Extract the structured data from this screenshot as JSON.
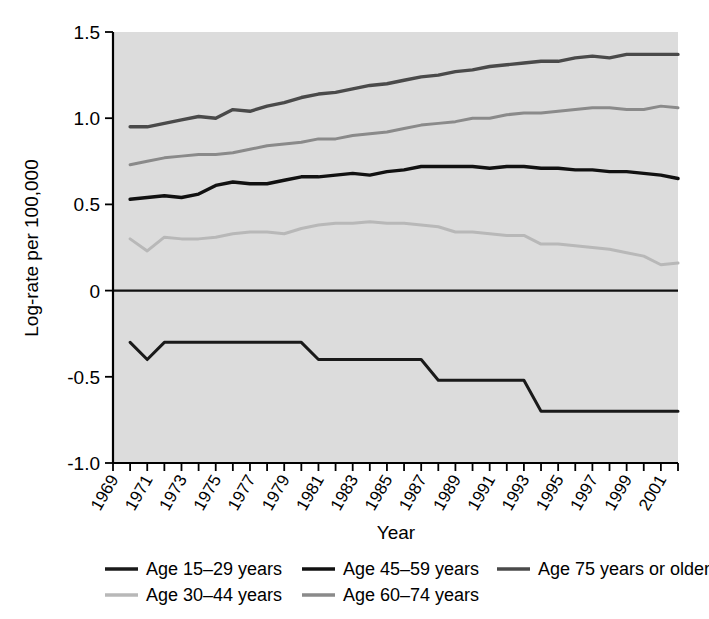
{
  "chart_data": {
    "type": "line",
    "title": "",
    "xlabel": "Year",
    "ylabel": "Log-rate per 100,000",
    "xlim": [
      1969,
      2002
    ],
    "ylim": [
      -1.0,
      1.5
    ],
    "yticks": [
      -1.0,
      -0.5,
      0,
      0.5,
      1.0,
      1.5
    ],
    "ytick_labels": [
      "-1.0",
      "-0.5",
      "0",
      "0.5",
      "1.0",
      "1.5"
    ],
    "xticks": [
      1969,
      1970,
      1971,
      1972,
      1973,
      1974,
      1975,
      1976,
      1977,
      1978,
      1979,
      1980,
      1981,
      1982,
      1983,
      1984,
      1985,
      1986,
      1987,
      1988,
      1989,
      1990,
      1991,
      1992,
      1993,
      1994,
      1995,
      1996,
      1997,
      1998,
      1999,
      2000,
      2001,
      2002
    ],
    "xtick_labels": [
      "1969",
      "1971",
      "1973",
      "1975",
      "1977",
      "1979",
      "1981",
      "1983",
      "1985",
      "1987",
      "1989",
      "1991",
      "1993",
      "1995",
      "1997",
      "1999",
      "2001"
    ],
    "xtick_label_years": [
      1969,
      1971,
      1973,
      1975,
      1977,
      1979,
      1981,
      1983,
      1985,
      1987,
      1989,
      1991,
      1993,
      1995,
      1997,
      1999,
      2001
    ],
    "grid": false,
    "legend_position": "bottom",
    "x": [
      1970,
      1971,
      1972,
      1973,
      1974,
      1975,
      1976,
      1977,
      1978,
      1979,
      1980,
      1981,
      1982,
      1983,
      1984,
      1985,
      1986,
      1987,
      1988,
      1989,
      1990,
      1991,
      1992,
      1993,
      1994,
      1995,
      1996,
      1997,
      1998,
      1999,
      2000,
      2001,
      2002
    ],
    "series": [
      {
        "name": "Age 15-29 years",
        "color": "#1a1a1a",
        "width": 3.0,
        "values": [
          -0.3,
          -0.4,
          -0.3,
          -0.3,
          -0.3,
          -0.3,
          -0.3,
          -0.3,
          -0.3,
          -0.3,
          -0.3,
          -0.4,
          -0.4,
          -0.4,
          -0.4,
          -0.4,
          -0.4,
          -0.4,
          -0.52,
          -0.52,
          -0.52,
          -0.52,
          -0.52,
          -0.52,
          -0.7,
          -0.7,
          -0.7,
          -0.7,
          -0.7,
          -0.7,
          -0.7,
          -0.7,
          -0.7
        ]
      },
      {
        "name": "Age 30-44 years",
        "color": "#b8b8b8",
        "width": 3.0,
        "values": [
          0.3,
          0.23,
          0.31,
          0.3,
          0.3,
          0.31,
          0.33,
          0.34,
          0.34,
          0.33,
          0.36,
          0.38,
          0.39,
          0.39,
          0.4,
          0.39,
          0.39,
          0.38,
          0.37,
          0.34,
          0.34,
          0.33,
          0.32,
          0.32,
          0.27,
          0.27,
          0.26,
          0.25,
          0.24,
          0.22,
          0.2,
          0.15,
          0.16
        ]
      },
      {
        "name": "Age 45-59 years",
        "color": "#111111",
        "width": 3.4,
        "values": [
          0.53,
          0.54,
          0.55,
          0.54,
          0.56,
          0.61,
          0.63,
          0.62,
          0.62,
          0.64,
          0.66,
          0.66,
          0.67,
          0.68,
          0.67,
          0.69,
          0.7,
          0.72,
          0.72,
          0.72,
          0.72,
          0.71,
          0.72,
          0.72,
          0.71,
          0.71,
          0.7,
          0.7,
          0.69,
          0.69,
          0.68,
          0.67,
          0.65
        ]
      },
      {
        "name": "Age 60-74 years",
        "color": "#8a8a8a",
        "width": 3.0,
        "values": [
          0.73,
          0.75,
          0.77,
          0.78,
          0.79,
          0.79,
          0.8,
          0.82,
          0.84,
          0.85,
          0.86,
          0.88,
          0.88,
          0.9,
          0.91,
          0.92,
          0.94,
          0.96,
          0.97,
          0.98,
          1.0,
          1.0,
          1.02,
          1.03,
          1.03,
          1.04,
          1.05,
          1.06,
          1.06,
          1.05,
          1.05,
          1.07,
          1.06
        ]
      },
      {
        "name": "Age 75 years or older",
        "color": "#4a4a4a",
        "width": 3.4,
        "values": [
          0.95,
          0.95,
          0.97,
          0.99,
          1.01,
          1.0,
          1.05,
          1.04,
          1.07,
          1.09,
          1.12,
          1.14,
          1.15,
          1.17,
          1.19,
          1.2,
          1.22,
          1.24,
          1.25,
          1.27,
          1.28,
          1.3,
          1.31,
          1.32,
          1.33,
          1.33,
          1.35,
          1.36,
          1.35,
          1.37,
          1.37,
          1.37,
          1.37
        ]
      }
    ]
  },
  "legend": {
    "entries": [
      {
        "label": "Age 15–29 years",
        "color": "#1a1a1a",
        "col": 0,
        "row": 0
      },
      {
        "label": "Age 30–44 years",
        "color": "#b8b8b8",
        "col": 0,
        "row": 1
      },
      {
        "label": "Age 45–59 years",
        "color": "#111111",
        "col": 1,
        "row": 0
      },
      {
        "label": "Age 60–74 years",
        "color": "#8a8a8a",
        "col": 1,
        "row": 1
      },
      {
        "label": "Age 75 years or older",
        "color": "#4a4a4a",
        "col": 2,
        "row": 0
      }
    ]
  },
  "axes": {
    "x_title": "Year",
    "y_title": "Log-rate per 100,000"
  },
  "colors": {
    "plot_background": "#dcdcdc",
    "page_background": "#ffffff",
    "axis": "#000000"
  }
}
